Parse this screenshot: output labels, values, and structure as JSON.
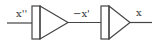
{
  "diagram": {
    "type": "block-diagram",
    "signals": {
      "input": "x''",
      "intermediate": "−x'",
      "output": "x"
    },
    "blocks": [
      {
        "id": "integrator-1",
        "input": "x''",
        "output": "−x'"
      },
      {
        "id": "integrator-2",
        "input": "−x'",
        "output": "x"
      }
    ],
    "colors": {
      "stroke": "#444444",
      "background": "#ffffff"
    }
  }
}
